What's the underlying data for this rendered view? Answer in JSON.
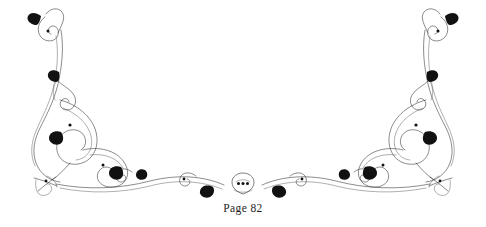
{
  "page": {
    "width": 486,
    "height": 227,
    "background_color": "#ffffff",
    "label": "Page 82"
  },
  "ornament": {
    "name": "symmetric-calligraphic-flourish",
    "description": "Hand-drawn pen-and-ink decorative border flourish, bilaterally symmetric about the vertical center axis, with tall scrolling verticals at left and right edges sweeping down into a shallow baseline that meets at a small central motif.",
    "ink_color": "#2b2b2b",
    "accent_color": "#111111",
    "stroke_width": 0.62,
    "symmetry_axis_x": 243,
    "elements": [
      {
        "name": "left-vertical-scroll",
        "position": "upper-left"
      },
      {
        "name": "left-top-curl-terminal",
        "position": "top-left"
      },
      {
        "name": "left-mid-leaf-accent",
        "position": "mid-left"
      },
      {
        "name": "left-lower-loop-cluster",
        "position": "lower-left"
      },
      {
        "name": "left-tassel-knot",
        "position": "bottom-left"
      },
      {
        "name": "left-baseline-sweep",
        "position": "bottom-center-left"
      },
      {
        "name": "center-shield-motif",
        "position": "center"
      },
      {
        "name": "right-baseline-sweep",
        "position": "bottom-center-right"
      },
      {
        "name": "right-tassel-knot",
        "position": "bottom-right"
      },
      {
        "name": "right-lower-loop-cluster",
        "position": "lower-right"
      },
      {
        "name": "right-mid-leaf-accent",
        "position": "mid-right"
      },
      {
        "name": "right-top-curl-terminal",
        "position": "top-right"
      },
      {
        "name": "right-vertical-scroll",
        "position": "upper-right"
      }
    ],
    "center_motif": {
      "name": "shield-with-three-dots",
      "dot_count": 3
    }
  }
}
